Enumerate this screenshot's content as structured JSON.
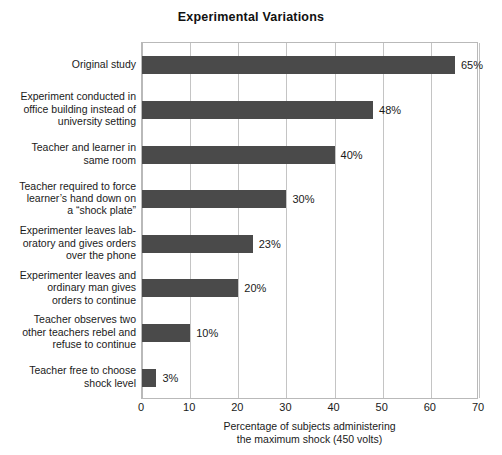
{
  "chart_data": {
    "type": "bar",
    "orientation": "horizontal",
    "title": "Experimental Variations",
    "xlabel_line1": "Percentage of subjects administering",
    "xlabel_line2": "the maximum shock (450 volts)",
    "ylabel": "",
    "xlim": [
      0,
      70
    ],
    "xticks": [
      0,
      10,
      20,
      30,
      40,
      50,
      60,
      70
    ],
    "xtick_labels": [
      "0",
      "10",
      "20",
      "30",
      "40",
      "50",
      "60",
      "70"
    ],
    "grid": true,
    "grid_axis": "x",
    "legend": false,
    "bar_color": "#4a4a4a",
    "categories": [
      "Original study",
      "Experiment conducted in office building instead of university setting",
      "Teacher and learner in same room",
      "Teacher required to force learner’s hand down on a “shock plate”",
      "Experimenter leaves laboratory and gives orders over the phone",
      "Experimenter leaves and ordinary man gives orders to continue",
      "Teacher observes two other teachers rebel and refuse to continue",
      "Teacher free to choose shock level"
    ],
    "category_lines": [
      [
        "Original study"
      ],
      [
        "Experiment conducted in",
        "office building instead of",
        "university setting"
      ],
      [
        "Teacher and learner in",
        "same room"
      ],
      [
        "Teacher required to force",
        "learner’s hand down on",
        "a “shock plate”"
      ],
      [
        "Experimenter leaves lab-",
        "oratory and gives orders",
        "over the phone"
      ],
      [
        "Experimenter leaves and",
        "ordinary man gives",
        "orders to continue"
      ],
      [
        "Teacher observes two",
        "other teachers rebel and",
        "refuse to continue"
      ],
      [
        "Teacher free to choose",
        "shock level"
      ]
    ],
    "values": [
      65,
      48,
      40,
      30,
      23,
      20,
      10,
      3
    ],
    "value_labels": [
      "65%",
      "48%",
      "40%",
      "30%",
      "23%",
      "20%",
      "10%",
      "3%"
    ]
  }
}
